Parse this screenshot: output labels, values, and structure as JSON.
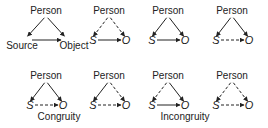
{
  "diagram": {
    "node_labels": {
      "person": "Person",
      "source_full": "Source",
      "object_full": "Object",
      "source_short": "S",
      "object_short": "O"
    },
    "line_legend": {
      "solid": "positive relation",
      "dashed": "negative relation"
    },
    "triangles": [
      {
        "row": 1,
        "col": 1,
        "labels": "full",
        "person_to_source": "solid",
        "person_to_object": "solid",
        "source_to_object": "solid"
      },
      {
        "row": 1,
        "col": 2,
        "labels": "short",
        "person_to_source": "dashed",
        "person_to_object": "dashed",
        "source_to_object": "solid"
      },
      {
        "row": 1,
        "col": 3,
        "labels": "short",
        "person_to_source": "solid",
        "person_to_object": "solid",
        "source_to_object": "solid"
      },
      {
        "row": 1,
        "col": 4,
        "labels": "short",
        "person_to_source": "solid",
        "person_to_object": "solid",
        "source_to_object": "dashed"
      },
      {
        "row": 2,
        "col": 1,
        "labels": "short",
        "person_to_source": "solid",
        "person_to_object": "solid",
        "source_to_object": "dashed"
      },
      {
        "row": 2,
        "col": 2,
        "labels": "short",
        "person_to_source": "solid",
        "person_to_object": "dashed",
        "source_to_object": "dashed"
      },
      {
        "row": 2,
        "col": 3,
        "labels": "short",
        "person_to_source": "dashed",
        "person_to_object": "solid",
        "source_to_object": "solid"
      },
      {
        "row": 2,
        "col": 4,
        "labels": "short",
        "person_to_source": "dashed",
        "person_to_object": "dashed",
        "source_to_object": "dashed"
      }
    ],
    "captions": {
      "congruity": "Congruity",
      "incongruity": "Incongruity"
    }
  }
}
